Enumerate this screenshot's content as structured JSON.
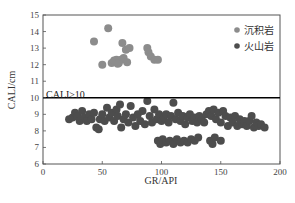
{
  "chart_data": {
    "type": "scatter",
    "title": "",
    "xlabel": "GR/API",
    "ylabel": "CALI/cm",
    "xlim": [
      0,
      200
    ],
    "ylim": [
      6,
      15
    ],
    "xticks": [
      0,
      50,
      100,
      150,
      200
    ],
    "yticks": [
      6,
      7,
      8,
      9,
      10,
      11,
      12,
      13,
      14,
      15
    ],
    "grid": false,
    "legend_position": "upper right",
    "annotations": [
      {
        "text": "CALI≥10",
        "x": 2,
        "y": 10.35,
        "type": "label"
      },
      {
        "type": "hline",
        "y": 10,
        "color": "#000000"
      }
    ],
    "series": [
      {
        "name": "沉积岩",
        "color": "#8c8c8c",
        "points": [
          [
            55,
            14.2
          ],
          [
            43,
            13.4
          ],
          [
            50,
            12.0
          ],
          [
            67,
            13.3
          ],
          [
            70,
            12.9
          ],
          [
            73,
            13.0
          ],
          [
            58,
            12.1
          ],
          [
            60,
            12.25
          ],
          [
            62,
            12.3
          ],
          [
            64,
            12.1
          ],
          [
            66,
            12.3
          ],
          [
            68,
            12.4
          ],
          [
            71,
            12.15
          ],
          [
            63,
            12.05
          ],
          [
            88,
            13.0
          ],
          [
            89,
            12.75
          ],
          [
            91,
            12.5
          ],
          [
            94,
            12.3
          ],
          [
            97,
            12.3
          ]
        ]
      },
      {
        "name": "火山岩",
        "color": "#4d4d4d",
        "points": [
          [
            22,
            8.7
          ],
          [
            25,
            8.8
          ],
          [
            27,
            9.1
          ],
          [
            29,
            8.9
          ],
          [
            31,
            8.6
          ],
          [
            33,
            9.2
          ],
          [
            35,
            8.8
          ],
          [
            37,
            8.6
          ],
          [
            39,
            9.0
          ],
          [
            41,
            8.7
          ],
          [
            43,
            9.1
          ],
          [
            45,
            8.2
          ],
          [
            47,
            8.1
          ],
          [
            48,
            8.7
          ],
          [
            50,
            9.0
          ],
          [
            52,
            8.6
          ],
          [
            54,
            9.4
          ],
          [
            56,
            8.8
          ],
          [
            58,
            9.1
          ],
          [
            60,
            8.6
          ],
          [
            62,
            9.3
          ],
          [
            63,
            8.9
          ],
          [
            65,
            9.6
          ],
          [
            66,
            8.2
          ],
          [
            68,
            8.7
          ],
          [
            70,
            9.0
          ],
          [
            72,
            8.5
          ],
          [
            74,
            9.5
          ],
          [
            76,
            8.8
          ],
          [
            78,
            8.3
          ],
          [
            80,
            9.0
          ],
          [
            82,
            8.6
          ],
          [
            84,
            9.2
          ],
          [
            86,
            8.4
          ],
          [
            88,
            9.8
          ],
          [
            90,
            8.9
          ],
          [
            92,
            8.5
          ],
          [
            94,
            9.3
          ],
          [
            96,
            8.7
          ],
          [
            98,
            9.0
          ],
          [
            100,
            8.6
          ],
          [
            102,
            8.8
          ],
          [
            104,
            9.0
          ],
          [
            106,
            8.5
          ],
          [
            108,
            8.9
          ],
          [
            110,
            9.7
          ],
          [
            112,
            8.7
          ],
          [
            114,
            9.1
          ],
          [
            116,
            8.6
          ],
          [
            118,
            8.9
          ],
          [
            120,
            8.4
          ],
          [
            122,
            8.8
          ],
          [
            124,
            9.0
          ],
          [
            126,
            8.6
          ],
          [
            128,
            8.8
          ],
          [
            130,
            8.5
          ],
          [
            132,
            8.9
          ],
          [
            134,
            8.7
          ],
          [
            136,
            8.5
          ],
          [
            138,
            9.0
          ],
          [
            140,
            9.2
          ],
          [
            142,
            8.9
          ],
          [
            144,
            9.3
          ],
          [
            146,
            8.7
          ],
          [
            148,
            9.1
          ],
          [
            150,
            8.5
          ],
          [
            152,
            9.2
          ],
          [
            154,
            8.9
          ],
          [
            156,
            8.3
          ],
          [
            158,
            8.8
          ],
          [
            160,
            8.5
          ],
          [
            162,
            8.9
          ],
          [
            164,
            8.3
          ],
          [
            166,
            8.7
          ],
          [
            168,
            8.4
          ],
          [
            170,
            8.6
          ],
          [
            172,
            8.3
          ],
          [
            174,
            8.6
          ],
          [
            176,
            8.9
          ],
          [
            178,
            8.2
          ],
          [
            180,
            8.5
          ],
          [
            182,
            8.3
          ],
          [
            184,
            8.4
          ],
          [
            187,
            8.2
          ],
          [
            97,
            7.4
          ],
          [
            99,
            7.2
          ],
          [
            101,
            7.5
          ],
          [
            104,
            7.3
          ],
          [
            107,
            7.4
          ],
          [
            110,
            7.2
          ],
          [
            113,
            7.5
          ],
          [
            116,
            7.3
          ],
          [
            119,
            7.4
          ],
          [
            122,
            7.3
          ],
          [
            125,
            7.5
          ],
          [
            128,
            7.4
          ],
          [
            131,
            7.6
          ],
          [
            141,
            7.4
          ],
          [
            143,
            7.2
          ],
          [
            145,
            7.6
          ],
          [
            150,
            7.4
          ]
        ]
      }
    ]
  },
  "legend": {
    "items": [
      {
        "label": "沉积岩",
        "color": "#8c8c8c"
      },
      {
        "label": "火山岩",
        "color": "#4d4d4d"
      }
    ]
  }
}
